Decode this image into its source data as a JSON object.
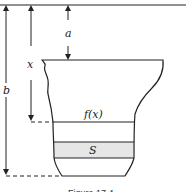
{
  "diagram": {
    "labels": {
      "a": "a",
      "x": "x",
      "b": "b",
      "fx": "f(x)",
      "s": "S"
    },
    "caption": "Figure 17.4",
    "colors": {
      "stroke": "#222222",
      "shaded_band": "#e6e6e6",
      "background": "#ffffff"
    }
  }
}
